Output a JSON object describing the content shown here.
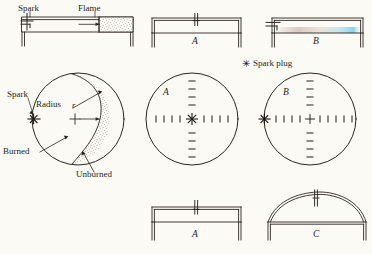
{
  "figure": {
    "background_color": "#fbfaf5",
    "ink_color": "#2a2622",
    "stipple_color": "#6b6255",
    "tint_color": "#7fc9e8",
    "legend": {
      "symbol": "spark-plug-star",
      "glyph": "✳",
      "label": "Spark plug",
      "x": 243,
      "y": 63
    },
    "labels": {
      "spark_top": "Spark",
      "flame_top": "Flame",
      "spark_circle": "Spark",
      "radius": "Radius",
      "radius_symbol": "r",
      "burned": "Burned",
      "unburned": "Unburned"
    },
    "panels": [
      {
        "id": "top-left-chamber",
        "name": "flame-propagation-chamber",
        "label": "",
        "shape": "rectangular-disc-chamber",
        "spark_position": "left",
        "regions": [
          "burned",
          "flame-front",
          "unburned"
        ]
      },
      {
        "id": "top-mid-chamber",
        "name": "chamber-A-top",
        "label": "A",
        "shape": "flat-rectangular",
        "spark_position": "center"
      },
      {
        "id": "top-right-chamber",
        "name": "chamber-B-top",
        "label": "B",
        "shape": "flat-rectangular",
        "spark_position": "left-edge"
      },
      {
        "id": "mid-left-circle",
        "name": "flame-front-circle",
        "label": "",
        "shape": "circle",
        "spark_position": "left-edge",
        "radius_arrow": true
      },
      {
        "id": "mid-center-circle",
        "name": "chamber-A-plan",
        "label": "A",
        "shape": "circle",
        "spark_position": "center"
      },
      {
        "id": "mid-right-circle",
        "name": "chamber-B-plan",
        "label": "B",
        "shape": "circle",
        "spark_position": "left-edge",
        "center_marker": "+"
      },
      {
        "id": "bottom-mid-chamber",
        "name": "chamber-A-bottom",
        "label": "A",
        "shape": "flat-rectangular",
        "spark_position": "center"
      },
      {
        "id": "bottom-right-chamber",
        "name": "chamber-C-bottom",
        "label": "C",
        "shape": "domed-roof",
        "spark_position": "center-top"
      }
    ]
  }
}
